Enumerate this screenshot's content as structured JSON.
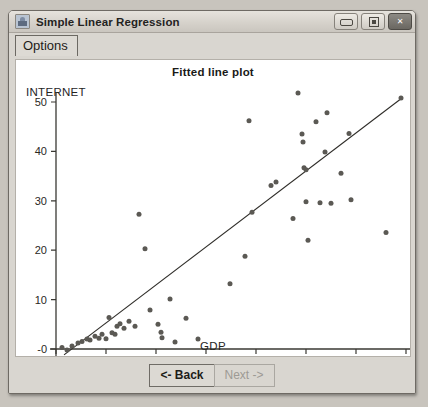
{
  "window": {
    "title": "Simple Linear Regression",
    "icon": "app-icon",
    "controls": [
      {
        "name": "minimize",
        "glyph": "–"
      },
      {
        "name": "maximize",
        "glyph": "□"
      },
      {
        "name": "close",
        "glyph": "✕"
      }
    ]
  },
  "menu": {
    "options_label": "Options"
  },
  "footer": {
    "back_label": "<- Back",
    "next_label": "Next ->"
  },
  "colors": {
    "window_bg": "#d9d6d0",
    "titlebar": "#dcd8d2",
    "plot_bg": "#ffffff",
    "axis": "#3a3833",
    "point": "#5b5954",
    "line": "#2e2c28"
  },
  "chart_data": {
    "type": "scatter",
    "title": "Fitted line plot",
    "xlabel": "GDP",
    "ylabel": "INTERNET",
    "xlim": [
      0,
      35
    ],
    "ylim": [
      -2,
      54
    ],
    "grid": false,
    "legend": null,
    "xticks": [
      0,
      5,
      10,
      15,
      20,
      25,
      30,
      35
    ],
    "xtick_labels": [
      "0",
      "5",
      "10",
      "15",
      "20",
      "25",
      "30",
      "35"
    ],
    "yticks": [
      0,
      10,
      20,
      30,
      40,
      50
    ],
    "ytick_labels": [
      "-0",
      "10",
      "20",
      "30",
      "40",
      "50"
    ],
    "series": [
      {
        "name": "observations",
        "marker": "filled-circle",
        "points": [
          [
            0.6,
            0.3
          ],
          [
            1.1,
            -0.2
          ],
          [
            1.6,
            0.6
          ],
          [
            2.2,
            1.2
          ],
          [
            2.6,
            1.5
          ],
          [
            3.1,
            2.0
          ],
          [
            3.4,
            1.8
          ],
          [
            3.9,
            2.6
          ],
          [
            4.3,
            2.2
          ],
          [
            4.6,
            3.0
          ],
          [
            5.0,
            2.1
          ],
          [
            5.3,
            6.4
          ],
          [
            5.6,
            3.3
          ],
          [
            5.9,
            3.0
          ],
          [
            6.1,
            4.6
          ],
          [
            6.4,
            5.1
          ],
          [
            6.8,
            4.2
          ],
          [
            7.3,
            5.6
          ],
          [
            7.9,
            4.6
          ],
          [
            8.3,
            27.3
          ],
          [
            8.9,
            20.3
          ],
          [
            9.4,
            7.9
          ],
          [
            10.2,
            5.0
          ],
          [
            10.5,
            3.4
          ],
          [
            10.6,
            2.3
          ],
          [
            11.4,
            10.1
          ],
          [
            11.9,
            1.4
          ],
          [
            13.0,
            6.2
          ],
          [
            14.2,
            2.0
          ],
          [
            17.4,
            13.2
          ],
          [
            18.9,
            18.8
          ],
          [
            19.3,
            46.2
          ],
          [
            19.6,
            27.7
          ],
          [
            21.5,
            33.1
          ],
          [
            22.0,
            33.8
          ],
          [
            23.7,
            26.4
          ],
          [
            24.2,
            51.8
          ],
          [
            24.6,
            43.5
          ],
          [
            24.7,
            41.9
          ],
          [
            24.8,
            36.7
          ],
          [
            25.0,
            36.3
          ],
          [
            25.0,
            29.8
          ],
          [
            25.2,
            22.0
          ],
          [
            26.0,
            46.0
          ],
          [
            26.4,
            29.6
          ],
          [
            26.9,
            39.9
          ],
          [
            27.1,
            47.8
          ],
          [
            27.5,
            29.5
          ],
          [
            28.5,
            35.6
          ],
          [
            29.3,
            43.6
          ],
          [
            29.5,
            30.2
          ],
          [
            33.0,
            23.6
          ],
          [
            34.5,
            50.8
          ]
        ]
      }
    ],
    "fit_line": {
      "name": "fitted line",
      "x_start": 0.8,
      "y_start": -1.2,
      "x_end": 34.6,
      "y_end": 50.8
    }
  }
}
